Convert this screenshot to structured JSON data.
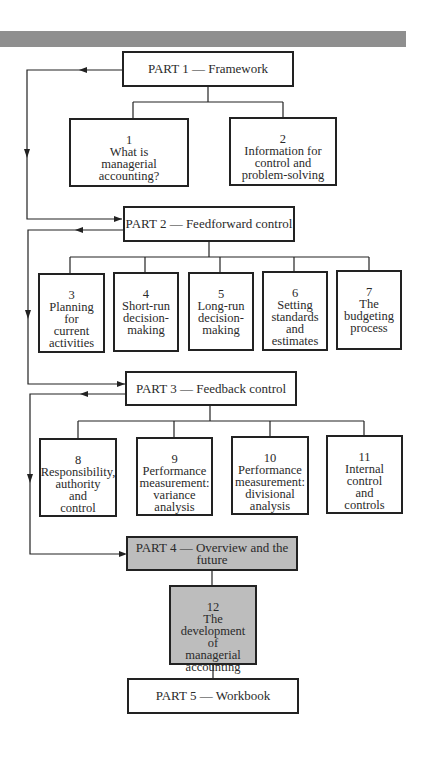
{
  "diagram": {
    "parts": [
      {
        "id": "p1",
        "label": "PART 1 — Framework",
        "shaded": false
      },
      {
        "id": "p2",
        "label": "PART 2 — Feedforward control",
        "shaded": false
      },
      {
        "id": "p3",
        "label": "PART 3 — Feedback control",
        "shaded": false
      },
      {
        "id": "p4",
        "label": "PART 4 — Overview and the future",
        "shaded": true
      },
      {
        "id": "p5",
        "label": "PART 5 — Workbook",
        "shaded": false
      }
    ],
    "chapters": [
      {
        "num": "1",
        "lines": [
          "What is",
          "managerial accounting?"
        ],
        "part": "p1"
      },
      {
        "num": "2",
        "lines": [
          "Information for",
          "control and",
          "problem-solving"
        ],
        "part": "p1"
      },
      {
        "num": "3",
        "lines": [
          "Planning",
          "for",
          "current",
          "activities"
        ],
        "part": "p2"
      },
      {
        "num": "4",
        "lines": [
          "Short-run",
          "decision-",
          "making"
        ],
        "part": "p2"
      },
      {
        "num": "5",
        "lines": [
          "Long-run",
          "decision-",
          "making"
        ],
        "part": "p2"
      },
      {
        "num": "6",
        "lines": [
          "Setting",
          "standards",
          "and",
          "estimates"
        ],
        "part": "p2"
      },
      {
        "num": "7",
        "lines": [
          "The",
          "budgeting",
          "process"
        ],
        "part": "p2"
      },
      {
        "num": "8",
        "lines": [
          "Responsibility,",
          "authority",
          "and",
          "control"
        ],
        "part": "p3"
      },
      {
        "num": "9",
        "lines": [
          "Performance",
          "measurement:",
          "variance",
          "analysis"
        ],
        "part": "p3"
      },
      {
        "num": "10",
        "lines": [
          "Performance",
          "measurement:",
          "divisional",
          "analysis"
        ],
        "part": "p3"
      },
      {
        "num": "11",
        "lines": [
          "Internal",
          "control",
          "and",
          "controls"
        ],
        "part": "p3"
      },
      {
        "num": "12",
        "lines": [
          "The development",
          "of",
          "managerial",
          "accounting"
        ],
        "part": "p4"
      }
    ],
    "colors": {
      "line": "#222222",
      "shaded_fill": "#bdbdbd",
      "top_bar": "#8f8f8f"
    }
  }
}
